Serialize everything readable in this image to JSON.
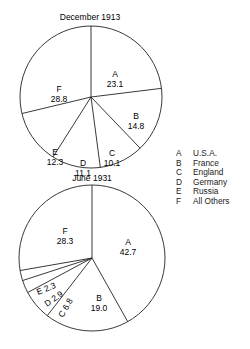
{
  "chart_data": [
    {
      "type": "pie",
      "title": "December 1913",
      "categories": [
        "A",
        "B",
        "C",
        "D",
        "E",
        "F"
      ],
      "values": [
        23.1,
        14.8,
        10.1,
        11.1,
        12.3,
        28.8
      ],
      "labels": [
        "A\n23.1",
        "B\n14.8",
        "C\n10.1",
        "D\n11.1",
        "E\n12.3",
        "F\n28.8"
      ],
      "start_angle": "12 o'clock, clockwise"
    },
    {
      "type": "pie",
      "title": "June 1931",
      "categories": [
        "A",
        "B",
        "C",
        "D",
        "E",
        "F"
      ],
      "values": [
        42.7,
        19.0,
        6.8,
        2.9,
        2.3,
        28.3
      ],
      "labels": [
        "A\n42.7",
        "B\n19.0",
        "C 6.8",
        "D 2.9",
        "E 2.3",
        "F\n28.3"
      ],
      "start_angle": "12 o'clock, clockwise"
    }
  ],
  "pie1": {
    "title": "December 1913",
    "slices": [
      {
        "key": "A",
        "value": "23.1"
      },
      {
        "key": "B",
        "value": "14.8"
      },
      {
        "key": "C",
        "value": "10.1"
      },
      {
        "key": "D",
        "value": "11.1"
      },
      {
        "key": "E",
        "value": "12.3"
      },
      {
        "key": "F",
        "value": "28.8"
      }
    ]
  },
  "pie2": {
    "title": "June 1931",
    "slices": [
      {
        "key": "A",
        "value": "42.7"
      },
      {
        "key": "B",
        "value": "19.0"
      },
      {
        "key": "C",
        "value": "6.8",
        "inline": "C 6.8"
      },
      {
        "key": "D",
        "value": "2.9",
        "inline": "D 2.9"
      },
      {
        "key": "E",
        "value": "2.3",
        "inline": "E 2.3"
      },
      {
        "key": "F",
        "value": "28.3"
      }
    ]
  },
  "legend": [
    {
      "key": "A",
      "label": "U.S.A."
    },
    {
      "key": "B",
      "label": "France"
    },
    {
      "key": "C",
      "label": "England"
    },
    {
      "key": "D",
      "label": "Germany"
    },
    {
      "key": "E",
      "label": "Russia"
    },
    {
      "key": "F",
      "label": "All Others"
    }
  ]
}
